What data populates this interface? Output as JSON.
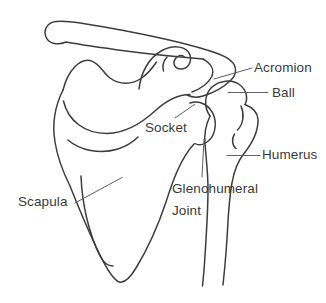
{
  "figure": {
    "background_color": "#ffffff",
    "outline_color": "#3d3d3d",
    "leader_line_color": "#5f5f5f",
    "label_color": "#3a3a3a",
    "labels": {
      "acromion": "Acromion",
      "ball": "Ball",
      "socket": "Socket",
      "humerus": "Humerus",
      "glenohumeral_joint": "Glenohumeral Joint",
      "scapula": "Scapula"
    }
  }
}
